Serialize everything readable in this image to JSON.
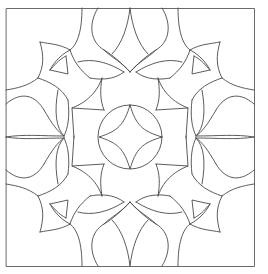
{
  "artwork": {
    "kind": "symmetric line-art mandala / coloring page",
    "background": "#ffffff",
    "stroke_color": "#4a4a4a",
    "stroke_width": 0.9,
    "frame": {
      "x": 6.5,
      "y": 8.5,
      "width": 248,
      "height": 258,
      "stroke_color": "#6a6a6a",
      "stroke_width": 1
    },
    "center": {
      "x": 130,
      "y": 137
    },
    "center_circle": {
      "cx": 130,
      "cy": 137,
      "r": 32
    },
    "center_star": "M130,105 C136,125 142,131 162,137 C142,143 136,149 130,169 C124,149 118,143 99,137 C118,131 124,125 130,105 Z",
    "quadrant_paths": [
      "M82,8 C82,30 78,44 70,50",
      "M70,50 C60,44 50,44 40,42",
      "M40,42 C44,56 44,66 38,78",
      "M38,78 C28,86 18,88 6,90",
      "M70,50 C58,56 52,66 50,70",
      "M50,70 L68,74 L66,56",
      "M66,56 C58,60 54,66 50,70",
      "M70,50 C74,62 80,70 90,78",
      "M90,78 C100,80 114,80 124,72",
      "M124,72 C108,62 92,58 78,62",
      "M102,78 C100,90 100,100 104,110",
      "M104,110 L72,108 C82,104 96,96 102,78",
      "M72,108 L74,138",
      "M38,78 C50,82 62,88 68,100",
      "M68,100 C70,116 68,128 64,136",
      "M64,136 C56,128 54,112 58,90",
      "M6,104 C22,90 36,96 44,110",
      "M44,110 C52,124 58,132 64,136",
      "M6,137 C24,134 42,136 64,136",
      "M98,8 C88,24 90,42 104,50",
      "M104,50 C114,56 120,62 130,72",
      "M130,8 C128,26 122,44 112,54",
      "M130,72 C122,62 112,58 104,50"
    ],
    "mirror_transforms": [
      "",
      "translate(260,0) scale(-1,1)",
      "translate(0,274) scale(1,-1)",
      "translate(260,274) scale(-1,-1)"
    ]
  }
}
